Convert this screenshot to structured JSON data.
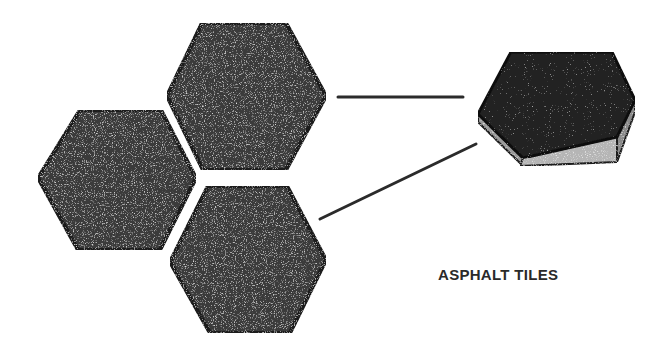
{
  "diagram": {
    "caption": "ASPHALT TILES",
    "colors": {
      "background": "#ffffff",
      "tile_fill": "#3a3a3a",
      "tile_edge": "#1a1a1a",
      "side_face_light": "#bdbdbd",
      "side_face_dark": "#8a8a8a",
      "connector_line": "#2b2b2b",
      "caption": "#2a2a2a"
    },
    "tiles": [
      {
        "name": "top-hexagon-tile",
        "points": "202,23 286,23 326,96 286,170 203,170 167,96"
      },
      {
        "name": "left-hexagon-tile",
        "points": "80,110 161,110 196,178 160,250 78,250 38,178"
      },
      {
        "name": "bottom-hexagon-tile",
        "points": "208,186 287,186 326,260 290,333 210,333 170,262"
      }
    ],
    "connectors": [
      {
        "name": "connector-line-top",
        "x1": 338,
        "y1": 97,
        "x2": 463,
        "y2": 97
      },
      {
        "name": "connector-line-bottom",
        "x1": 320,
        "y1": 219,
        "x2": 476,
        "y2": 144
      }
    ],
    "tile_3d": {
      "top_face": "511,52 612,52 635,100 617,137 523,158 478,114",
      "left_side": "478,114 523,158 523,166 478,122",
      "front_side": "523,158 617,137 617,162 520,166",
      "right_side": "617,137 635,100 635,112 617,162"
    }
  }
}
